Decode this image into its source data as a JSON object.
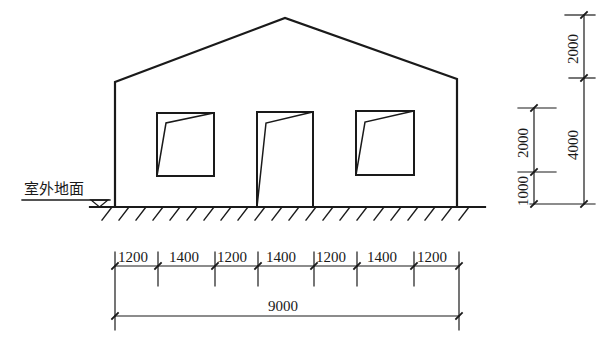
{
  "drawing": {
    "type": "building elevation",
    "ground_label": "室外地面",
    "colors": {
      "line": "#1a1a1a",
      "background": "#ffffff"
    }
  },
  "horizontal_dimensions": {
    "segments": [
      "1200",
      "1400",
      "1200",
      "1400",
      "1200",
      "1400",
      "1200"
    ],
    "total": "9000"
  },
  "vertical_dimensions": {
    "inner_chain": [
      "1000",
      "2000"
    ],
    "outer_chain": [
      "4000",
      "2000"
    ]
  },
  "elements": {
    "windows": 2,
    "doors": 1
  }
}
